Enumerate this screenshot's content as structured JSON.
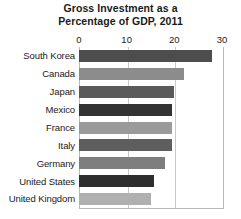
{
  "chart_data": {
    "type": "bar",
    "orientation": "horizontal",
    "title": "Gross Investment as a Percentage of GDP, 2011",
    "title_lines": [
      "Gross Investment as a",
      "Percentage of GDP, 2011"
    ],
    "xlabel": "",
    "ylabel": "",
    "xlim": [
      0,
      30
    ],
    "ylim": null,
    "grid": true,
    "gridlines_x": [
      0,
      10,
      20,
      30
    ],
    "legend": false,
    "legend_position": "none",
    "xticks": [
      {
        "value": 0,
        "label": "0"
      },
      {
        "value": 10,
        "label": "10"
      },
      {
        "value": 20,
        "label": "20"
      },
      {
        "value": 30,
        "label": "30"
      }
    ],
    "categories": [
      "South Korea",
      "Canada",
      "Japan",
      "Mexico",
      "France",
      "Italy",
      "Germany",
      "United States",
      "United Kingdom"
    ],
    "values": [
      28,
      22,
      20,
      19.5,
      19.5,
      19.5,
      18,
      15.8,
      15
    ],
    "bar_colors": [
      "#4d4d4d",
      "#8c8c8c",
      "#5a5a5a",
      "#333333",
      "#9a9a9a",
      "#5e5e5e",
      "#7e7e7e",
      "#2e2e2e",
      "#b0b0b0"
    ],
    "bars": [
      {
        "category": "South Korea",
        "value": 28,
        "color": "#4d4d4d"
      },
      {
        "category": "Canada",
        "value": 22,
        "color": "#8c8c8c"
      },
      {
        "category": "Japan",
        "value": 20,
        "color": "#5a5a5a"
      },
      {
        "category": "Mexico",
        "value": 19.5,
        "color": "#333333"
      },
      {
        "category": "France",
        "value": 19.5,
        "color": "#9a9a9a"
      },
      {
        "category": "Italy",
        "value": 19.5,
        "color": "#5e5e5e"
      },
      {
        "category": "Germany",
        "value": 18,
        "color": "#7e7e7e"
      },
      {
        "category": "United States",
        "value": 15.8,
        "color": "#2e2e2e"
      },
      {
        "category": "United Kingdom",
        "value": 15,
        "color": "#b0b0b0"
      }
    ],
    "colors": {
      "background": "#ffffff",
      "text": "#1a1a1a",
      "gridline": "#c9c9c9",
      "axis_border": "#b9b9b9"
    }
  }
}
